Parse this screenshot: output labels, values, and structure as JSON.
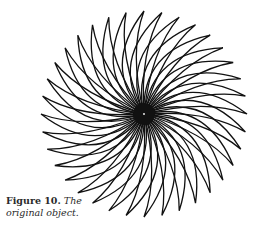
{
  "figure": {
    "center": [
      144,
      114
    ],
    "radius": 103,
    "petal_count": 36,
    "petal_width": 0.42,
    "twist_deg": 38,
    "stroke_color": "#111111",
    "core_radius": 11
  },
  "caption": {
    "label": "Figure 10.",
    "text": "The original object."
  }
}
